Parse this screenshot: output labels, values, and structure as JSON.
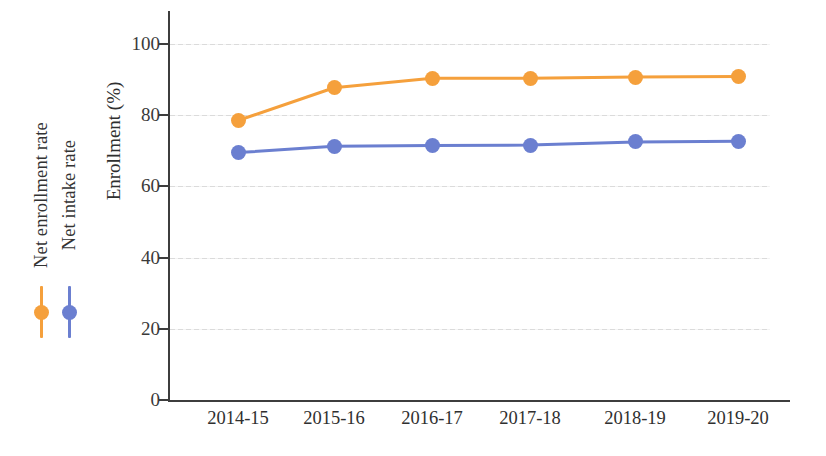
{
  "chart_data": {
    "type": "line",
    "title": "",
    "xlabel": "",
    "ylabel": "Enrollment (%)",
    "categories": [
      "2014-15",
      "2015-16",
      "2016-17",
      "2017-18",
      "2018-19",
      "2019-20"
    ],
    "ylim": [
      0,
      100
    ],
    "yticks": [
      0,
      20,
      40,
      60,
      80,
      100
    ],
    "ytick_labels": [
      "0",
      "20",
      "40",
      "60",
      "80",
      "100"
    ],
    "grid": true,
    "legend_position": "left-outside-rotated",
    "series": [
      {
        "name": "Net enrollment rate",
        "color": "#F5A03C",
        "marker": "circle",
        "values": [
          78.5,
          87.7,
          90.4,
          90.4,
          90.7,
          90.9
        ]
      },
      {
        "name": "Net intake rate",
        "color": "#6B7FD0",
        "marker": "circle",
        "values": [
          69.5,
          71.3,
          71.5,
          71.6,
          72.5,
          72.7
        ]
      }
    ]
  },
  "colors": {
    "orange": "#F5A03C",
    "blue": "#6B7FD0",
    "axis": "#3d3d3d",
    "grid": "#d9d9d9",
    "text": "#2f2f2f",
    "background": "#ffffff"
  }
}
